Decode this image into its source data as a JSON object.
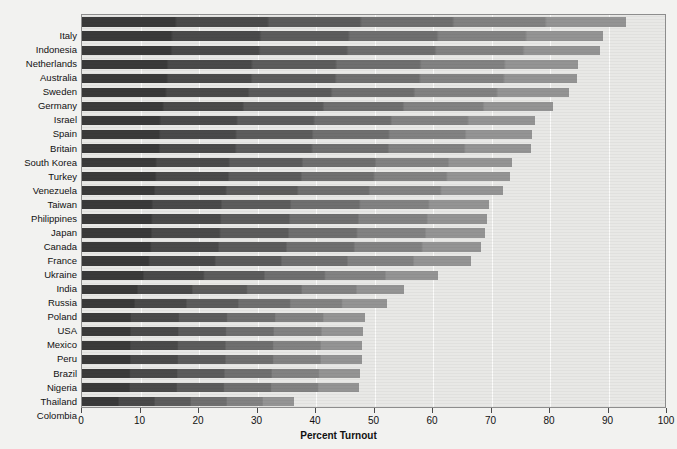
{
  "chart_data": {
    "type": "bar",
    "orientation": "horizontal",
    "title": "",
    "xlabel": "Percent Turnout",
    "ylabel": "",
    "xlim": [
      0,
      100
    ],
    "xticks": [
      0,
      10,
      20,
      30,
      40,
      50,
      60,
      70,
      80,
      90,
      100
    ],
    "grid": true,
    "legend": "none",
    "categories": [
      "Italy",
      "Indonesia",
      "Netherlands",
      "Australia",
      "Sweden",
      "Germany",
      "Israel",
      "Spain",
      "Britain",
      "South Korea",
      "Turkey",
      "Venezuela",
      "Taiwan",
      "Philippines",
      "Japan",
      "Canada",
      "France",
      "Ukraine",
      "India",
      "Russia",
      "Poland",
      "USA",
      "Mexico",
      "Peru",
      "Brazil",
      "Nigeria",
      "Thailand",
      "Colombia"
    ],
    "values": [
      93.0,
      89.0,
      88.5,
      84.8,
      84.6,
      83.3,
      80.5,
      77.5,
      77.0,
      76.8,
      73.5,
      73.2,
      72.0,
      69.6,
      69.2,
      68.9,
      68.2,
      66.5,
      60.9,
      55.0,
      52.1,
      48.3,
      48.0,
      47.9,
      47.8,
      47.6,
      47.3,
      36.2
    ],
    "colors": {
      "bar_dark": "#3a3a3a",
      "bar_light": "#949494",
      "plot_background": "#e8e8e6",
      "page_background": "#f2f2f0",
      "gridline": "#fbfbfa",
      "axis": "#8d8d8d",
      "text": "#111111"
    }
  },
  "axis": {
    "x_title": "Percent Turnout",
    "tick_labels": [
      "0",
      "10",
      "20",
      "30",
      "40",
      "50",
      "60",
      "70",
      "80",
      "90",
      "100"
    ]
  }
}
